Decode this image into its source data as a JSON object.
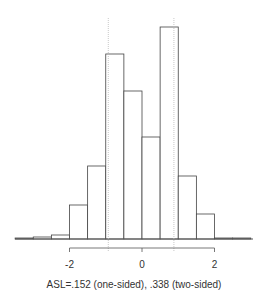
{
  "chart_data": {
    "type": "bar",
    "subtype": "histogram",
    "title": "",
    "xlabel": "ASL=.152 (one-sided), .338 (two-sided)",
    "ylabel": "",
    "bin_edges": [
      -3.5,
      -3.0,
      -2.5,
      -2.0,
      -1.5,
      -1.0,
      -0.5,
      0.0,
      0.5,
      1.0,
      1.5,
      2.0,
      2.5,
      3.0
    ],
    "values": [
      1,
      2,
      4,
      34,
      73,
      185,
      148,
      102,
      212,
      63,
      25,
      1,
      1
    ],
    "x_ticks": [
      -2,
      0,
      2
    ],
    "x_tick_labels": [
      "-2",
      "0",
      "2"
    ],
    "xlim": [
      -3.5,
      3.0
    ],
    "y_axis_shown": false,
    "grid": false,
    "reference_lines": [
      {
        "x": -0.93,
        "style": "dotted",
        "color": "#bbbbbb"
      },
      {
        "x": 0.88,
        "style": "dotted",
        "color": "#bbbbbb"
      }
    ],
    "bar_fill": "#ffffff",
    "bar_stroke": "#444444"
  },
  "caption": "ASL=.152 (one-sided), .338 (two-sided)"
}
